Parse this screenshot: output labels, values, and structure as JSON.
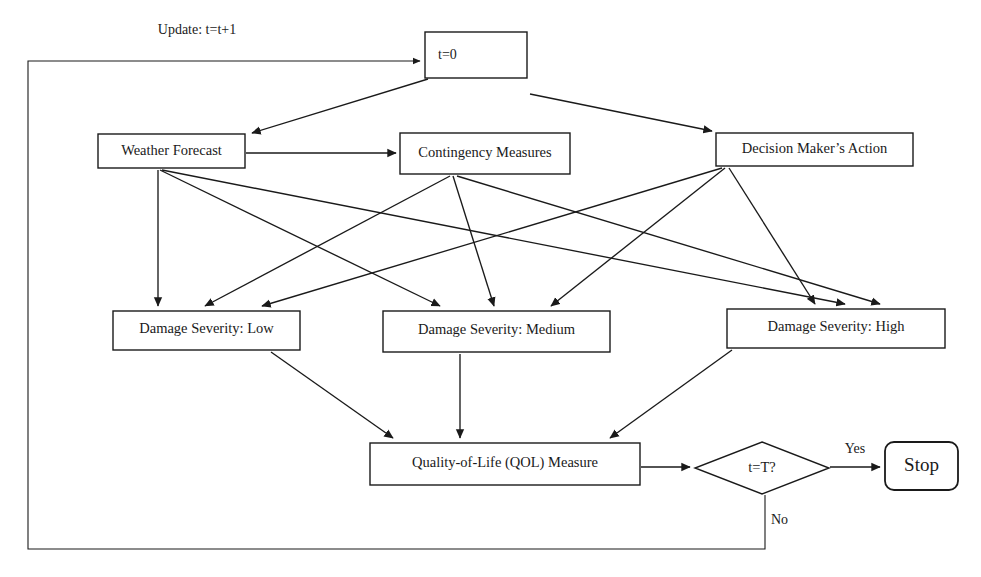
{
  "diagram": {
    "canvas": {
      "width": 981,
      "height": 577
    },
    "colors": {
      "background": "#ffffff",
      "stroke": "#1a1a1a",
      "fill": "#ffffff"
    },
    "nodes": {
      "init": {
        "label": "t=0",
        "shape": "rectangle",
        "x": 425,
        "y": 32,
        "w": 102,
        "h": 46
      },
      "weather_forecast": {
        "label": "Weather Forecast",
        "shape": "rectangle",
        "x": 98,
        "y": 134,
        "w": 147,
        "h": 34
      },
      "contingency_measures": {
        "label": "Contingency Measures",
        "shape": "rectangle",
        "x": 400,
        "y": 133,
        "w": 170,
        "h": 41
      },
      "decision_maker_action": {
        "label": "Decision Maker’s Action",
        "shape": "rectangle",
        "x": 716,
        "y": 133,
        "w": 197,
        "h": 33
      },
      "damage_low": {
        "label": "Damage Severity: Low",
        "shape": "rectangle",
        "x": 113,
        "y": 311,
        "w": 187,
        "h": 39
      },
      "damage_medium": {
        "label": "Damage Severity: Medium",
        "shape": "rectangle",
        "x": 383,
        "y": 311,
        "w": 227,
        "h": 41
      },
      "damage_high": {
        "label": "Damage Severity: High",
        "shape": "rectangle",
        "x": 727,
        "y": 309,
        "w": 218,
        "h": 39
      },
      "qol_measure": {
        "label": "Quality-of-Life (QOL) Measure",
        "shape": "rectangle",
        "x": 370,
        "y": 443,
        "w": 270,
        "h": 42
      },
      "terminal_check": {
        "label": "t=T?",
        "shape": "diamond",
        "cx": 762,
        "cy": 468,
        "rx": 67,
        "ry": 26
      },
      "stop": {
        "label": "Stop",
        "shape": "rounded-rectangle",
        "x": 885,
        "y": 442,
        "w": 73,
        "h": 48
      }
    },
    "edge_labels": {
      "update": "Update: t=t+1",
      "yes": "Yes",
      "no": "No"
    },
    "edges": [
      {
        "from": "feedback-loop",
        "to": "init"
      },
      {
        "from": "init",
        "to": "weather_forecast"
      },
      {
        "from": "init",
        "to": "decision_maker_action"
      },
      {
        "from": "weather_forecast",
        "to": "contingency_measures"
      },
      {
        "from": "weather_forecast",
        "to": "damage_low"
      },
      {
        "from": "weather_forecast",
        "to": "damage_medium"
      },
      {
        "from": "weather_forecast",
        "to": "damage_high"
      },
      {
        "from": "contingency_measures",
        "to": "damage_low"
      },
      {
        "from": "contingency_measures",
        "to": "damage_medium"
      },
      {
        "from": "contingency_measures",
        "to": "damage_high"
      },
      {
        "from": "decision_maker_action",
        "to": "damage_low"
      },
      {
        "from": "decision_maker_action",
        "to": "damage_medium"
      },
      {
        "from": "decision_maker_action",
        "to": "damage_high"
      },
      {
        "from": "damage_low",
        "to": "qol_measure"
      },
      {
        "from": "damage_medium",
        "to": "qol_measure"
      },
      {
        "from": "damage_high",
        "to": "qol_measure"
      },
      {
        "from": "qol_measure",
        "to": "terminal_check"
      },
      {
        "from": "terminal_check",
        "to": "stop",
        "label": "Yes"
      },
      {
        "from": "terminal_check",
        "to": "feedback-loop",
        "label": "No"
      }
    ]
  }
}
